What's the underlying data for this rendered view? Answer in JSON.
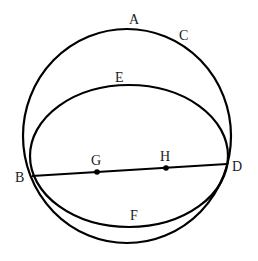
{
  "diagram": {
    "type": "geometry",
    "colors": {
      "stroke": "#000000",
      "background": "#ffffff",
      "text": "#1a1a1a"
    },
    "circle": {
      "cx": 127,
      "cy": 136,
      "rx": 104,
      "ry": 107
    },
    "ellipse": {
      "cx": 129,
      "cy": 156,
      "rx": 99,
      "ry": 71
    },
    "segment": {
      "from": "B",
      "to": "D"
    },
    "labels": {
      "A": "A",
      "B": "B",
      "C": "C",
      "D": "D",
      "E": "E",
      "F": "F",
      "G": "G",
      "H": "H"
    },
    "points": {
      "B": [
        32,
        176
      ],
      "D": [
        227,
        164
      ],
      "G": [
        97,
        172
      ],
      "H": [
        166,
        168
      ]
    }
  }
}
